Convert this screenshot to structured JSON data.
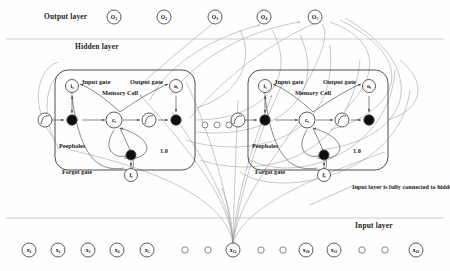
{
  "diagram": {
    "colors": {
      "node_stroke": "#4a4a4a",
      "block_stroke": "#3d3d3d",
      "arrow": "#555555",
      "long_connection": "#9a9a9a",
      "divider": "#b8b8b8",
      "text": "#111111",
      "filled_node": "#0d0d0d"
    }
  },
  "labels": {
    "output_layer": "Output layer",
    "hidden_layer": "Hidden layer",
    "input_layer": "Input layer",
    "annotation": "Input layer is fully connected to hidden layer"
  },
  "output_layer": {
    "nodes": [
      {
        "label": "O",
        "sub": "1",
        "x": 114,
        "y": 17
      },
      {
        "label": "O",
        "sub": "2",
        "x": 164,
        "y": 17
      },
      {
        "label": "O",
        "sub": "3",
        "x": 215,
        "y": 17
      },
      {
        "label": "O",
        "sub": "4",
        "x": 264,
        "y": 17
      },
      {
        "label": "O",
        "sub": "5",
        "x": 315,
        "y": 17
      }
    ]
  },
  "input_layer": {
    "nodes": [
      {
        "label": "x",
        "sub": "1",
        "x": 29,
        "y": 250,
        "labeled": true
      },
      {
        "label": "x",
        "sub": "2",
        "x": 58,
        "y": 250,
        "labeled": true
      },
      {
        "label": "x",
        "sub": "3",
        "x": 88,
        "y": 250,
        "labeled": true
      },
      {
        "label": "x",
        "sub": "4",
        "x": 117,
        "y": 250,
        "labeled": true
      },
      {
        "label": "x",
        "sub": "5",
        "x": 147,
        "y": 250,
        "labeled": true
      },
      {
        "label": "",
        "sub": "",
        "x": 185,
        "y": 250,
        "labeled": false
      },
      {
        "label": "",
        "sub": "",
        "x": 208,
        "y": 250,
        "labeled": false
      },
      {
        "label": "x",
        "sub": "12",
        "x": 233,
        "y": 250,
        "labeled": true
      },
      {
        "label": "",
        "sub": "",
        "x": 261,
        "y": 250,
        "labeled": false
      },
      {
        "label": "",
        "sub": "",
        "x": 283,
        "y": 250,
        "labeled": false
      },
      {
        "label": "x",
        "sub": "30",
        "x": 306,
        "y": 250,
        "labeled": true
      },
      {
        "label": "x",
        "sub": "31",
        "x": 334,
        "y": 250,
        "labeled": true
      },
      {
        "label": "",
        "sub": "",
        "x": 362,
        "y": 250,
        "labeled": false
      },
      {
        "label": "",
        "sub": "",
        "x": 385,
        "y": 250,
        "labeled": false
      },
      {
        "label": "x",
        "sub": "41",
        "x": 416,
        "y": 250,
        "labeled": true
      }
    ]
  },
  "ellipsis_dots": [
    {
      "x": 205,
      "y": 125
    },
    {
      "x": 217,
      "y": 125
    },
    {
      "x": 229,
      "y": 125
    }
  ],
  "memory_blocks": [
    {
      "name": "memory-block-1",
      "x": 55,
      "y": 70,
      "w": 140,
      "h": 100,
      "input_gate": {
        "label": "i",
        "sub": "t",
        "text": "Input gate"
      },
      "output_gate": {
        "label": "o",
        "sub": "t",
        "text": "Output gate"
      },
      "forget_gate": {
        "label": "f",
        "sub": "t",
        "text": "Forget gate"
      },
      "cell": {
        "label": "c",
        "sub": "t",
        "text": "Memory Cell"
      },
      "peepholes": "Peepholes",
      "recurrent_weight": "1.0"
    },
    {
      "name": "memory-block-2",
      "x": 248,
      "y": 70,
      "w": 140,
      "h": 100,
      "input_gate": {
        "label": "i",
        "sub": "t",
        "text": "Input gate"
      },
      "output_gate": {
        "label": "o",
        "sub": "t",
        "text": "Output gate"
      },
      "forget_gate": {
        "label": "f",
        "sub": "t",
        "text": "Forget gate"
      },
      "cell": {
        "label": "c",
        "sub": "t",
        "text": "Memory Cell"
      },
      "peepholes": "Peepholes",
      "recurrent_weight": "1.0"
    }
  ]
}
